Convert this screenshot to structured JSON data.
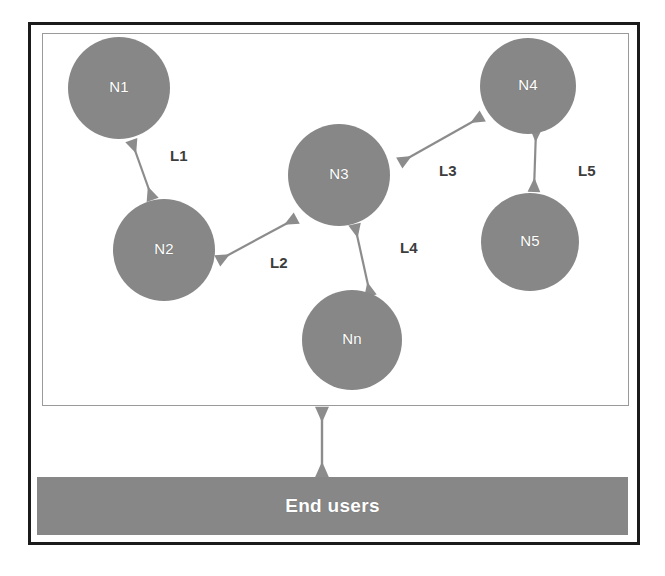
{
  "diagram": {
    "outer_frame": {
      "border_color": "#1b1b1b"
    },
    "network_box": {
      "border_color": "#9a9a9a"
    },
    "palette": {
      "node_fill": "#878787",
      "node_text": "#ffffff",
      "arrow": "#8c8c8c",
      "label_text": "#3d3d3d",
      "bar_fill": "#878787",
      "bar_text": "#ffffff",
      "background": "#ffffff"
    },
    "nodes": [
      {
        "id": "n1",
        "label": "N1",
        "cx": 119,
        "cy": 88,
        "r": 51
      },
      {
        "id": "n2",
        "label": "N2",
        "cx": 164,
        "cy": 250,
        "r": 51
      },
      {
        "id": "n3",
        "label": "N3",
        "cx": 339,
        "cy": 175,
        "r": 51
      },
      {
        "id": "n4",
        "label": "N4",
        "cx": 528,
        "cy": 86,
        "r": 48
      },
      {
        "id": "n5",
        "label": "N5",
        "cx": 530,
        "cy": 242,
        "r": 49
      },
      {
        "id": "nn",
        "label": "Nn",
        "cx": 352,
        "cy": 340,
        "r": 50
      }
    ],
    "links": [
      {
        "id": "l1",
        "label": "L1",
        "from": "n1",
        "to": "n2",
        "label_x": 170,
        "label_y": 147
      },
      {
        "id": "l2",
        "label": "L2",
        "from": "n2",
        "to": "n3",
        "label_x": 270,
        "label_y": 254
      },
      {
        "id": "l3",
        "label": "L3",
        "from": "n3",
        "to": "n4",
        "label_x": 439,
        "label_y": 162
      },
      {
        "id": "l4",
        "label": "L4",
        "from": "n3",
        "to": "nn",
        "label_x": 400,
        "label_y": 239
      },
      {
        "id": "l5",
        "label": "L5",
        "from": "n4",
        "to": "n5",
        "label_x": 578,
        "label_y": 162
      }
    ],
    "end_users": {
      "label": "End users"
    },
    "connector": {
      "name": "network-to-end-users-connector",
      "from": "network-box",
      "to": "end-users-bar"
    }
  }
}
